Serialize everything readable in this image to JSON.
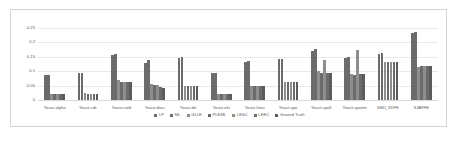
{
  "chart_data": {
    "type": "bar",
    "title": "",
    "subtitle": "",
    "xlabel": "",
    "ylabel": "",
    "ylim": [
      0,
      0.27
    ],
    "grid": true,
    "legend_position": "bottom",
    "yticks": [
      "0.25",
      "0.2",
      "0.15",
      "0.1",
      "0.05",
      "0"
    ],
    "ytick_values": [
      0.25,
      0.2,
      0.15,
      0.1,
      0.05,
      0
    ],
    "categories": [
      "Yeast-alpha",
      "Yeast-cdc",
      "Yeast-cold",
      "Yeast-diau",
      "Yeast-dtt",
      "Yeast-elu",
      "Yeast-heat",
      "Yeast-spo",
      "Yeast-spo5",
      "Yeast-spoem",
      "SBU_3DFE",
      "SJAFFE"
    ],
    "series": [
      {
        "name": "LP",
        "color": "#6b6b6b",
        "values": [
          0.088,
          0.094,
          0.157,
          0.127,
          0.147,
          0.093,
          0.133,
          0.141,
          0.171,
          0.147,
          0.16,
          0.233
        ]
      },
      {
        "name": "ML",
        "color": "#6b6b6b",
        "values": [
          0.088,
          0.094,
          0.159,
          0.138,
          0.15,
          0.093,
          0.136,
          0.141,
          0.175,
          0.148,
          0.162,
          0.237
        ]
      },
      {
        "name": "GLLE",
        "color": "#8e8e8e",
        "values": [
          0.022,
          0.023,
          0.068,
          0.055,
          0.049,
          0.022,
          0.05,
          0.062,
          0.099,
          0.089,
          0.133,
          0.116
        ]
      },
      {
        "name": "PLEML",
        "color": "#6b6b6b",
        "values": [
          0.02,
          0.021,
          0.064,
          0.052,
          0.048,
          0.021,
          0.049,
          0.062,
          0.095,
          0.088,
          0.133,
          0.117
        ]
      },
      {
        "name": "LESC",
        "color": "#8e8e8e",
        "values": [
          0.02,
          0.021,
          0.064,
          0.052,
          0.048,
          0.021,
          0.049,
          0.062,
          0.138,
          0.172,
          0.133,
          0.117
        ]
      },
      {
        "name": "LEEC",
        "color": "#6b6b6b",
        "values": [
          0.02,
          0.021,
          0.061,
          0.046,
          0.048,
          0.021,
          0.049,
          0.062,
          0.095,
          0.089,
          0.133,
          0.117
        ]
      },
      {
        "name": "Ground Truth",
        "color": "#5c5c5c",
        "values": [
          0.02,
          0.021,
          0.061,
          0.042,
          0.047,
          0.021,
          0.049,
          0.062,
          0.094,
          0.089,
          0.13,
          0.117
        ]
      }
    ]
  }
}
